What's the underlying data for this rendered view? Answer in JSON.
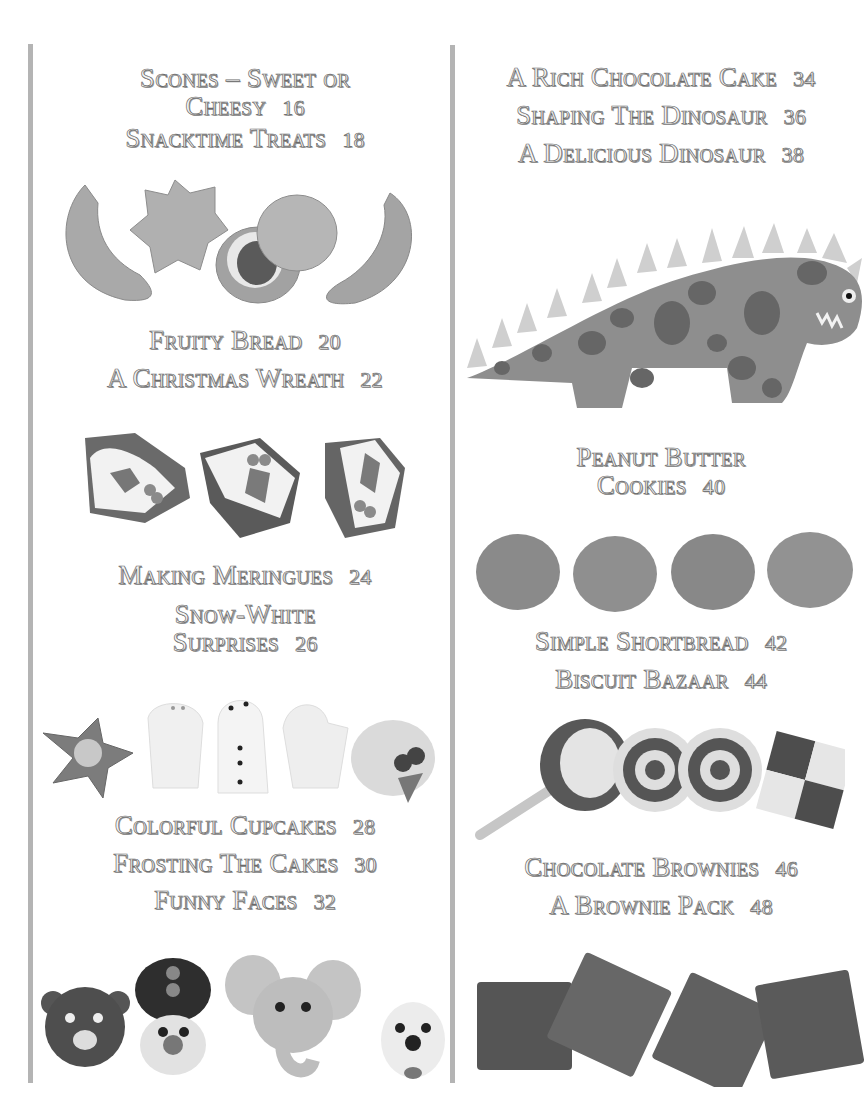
{
  "page": {
    "background": "#ffffff",
    "rule_color": "#b4b4b4",
    "text_fill": "#f4f4f4",
    "text_stroke": "#6a6a6a"
  },
  "left_column": {
    "entries": [
      {
        "title_line1": "Scones – Sweet or",
        "title_line2": "Cheesy",
        "page": "16"
      },
      {
        "title": "Snacktime Treats",
        "page": "18"
      },
      {
        "title": "Fruity Bread",
        "page": "20"
      },
      {
        "title": "A Christmas Wreath",
        "page": "22"
      },
      {
        "title": "Making Meringues",
        "page": "24"
      },
      {
        "title_line1": "Snow-White",
        "title_line2": "Surprises",
        "page": "26"
      },
      {
        "title": "Colorful Cupcakes",
        "page": "28"
      },
      {
        "title": "Frosting The Cakes",
        "page": "30"
      },
      {
        "title": "Funny Faces",
        "page": "32"
      }
    ],
    "photos": [
      {
        "name": "scones-and-snacktime-photo",
        "items": [
          "crescent",
          "star",
          "jam-tart",
          "round-scone",
          "crescent"
        ]
      },
      {
        "name": "christmas-wreath-photo",
        "items": [
          "iced-slice-holly",
          "iced-slice-holly",
          "iced-slice-holly"
        ]
      },
      {
        "name": "meringues-photo",
        "items": [
          "strawberry-star",
          "ghost",
          "snowman",
          "ghost",
          "fruit-nest"
        ]
      },
      {
        "name": "funny-faces-photo",
        "items": [
          "bear",
          "soldier",
          "elephant",
          "dog"
        ]
      }
    ]
  },
  "right_column": {
    "entries": [
      {
        "title": "A Rich Chocolate Cake",
        "page": "34"
      },
      {
        "title": "Shaping The Dinosaur",
        "page": "36"
      },
      {
        "title": "A Delicious Dinosaur",
        "page": "38"
      },
      {
        "title_line1": "Peanut Butter",
        "title_line2": "Cookies",
        "page": "40"
      },
      {
        "title": "Simple Shortbread",
        "page": "42"
      },
      {
        "title": "Biscuit Bazaar",
        "page": "44"
      },
      {
        "title": "Chocolate Brownies",
        "page": "46"
      },
      {
        "title": "A Brownie Pack",
        "page": "48"
      }
    ],
    "photos": [
      {
        "name": "dinosaur-cake-photo",
        "items": [
          "spotted-dinosaur"
        ]
      },
      {
        "name": "peanut-cookies-photo",
        "items": [
          "cookie",
          "cookie",
          "cookie",
          "cookie"
        ]
      },
      {
        "name": "biscuit-bazaar-photo",
        "items": [
          "lollipop-biscuit",
          "swirl-biscuits",
          "checker-biscuit"
        ]
      },
      {
        "name": "brownies-photo",
        "items": [
          "brownie",
          "brownie",
          "brownie",
          "brownie"
        ]
      }
    ]
  }
}
